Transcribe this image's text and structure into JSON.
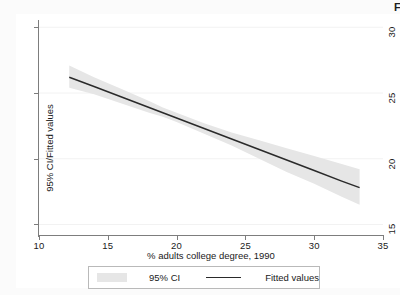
{
  "figure": {
    "corner_artifact": "F",
    "background": "#ffffff"
  },
  "chart_data": {
    "type": "line",
    "title": "",
    "xlabel": "% adults college degree, 1990",
    "ylabel": "95% CI/Fitted values",
    "xlim": [
      10,
      35
    ],
    "ylim": [
      14.2,
      30.4
    ],
    "xticks": [
      10,
      15,
      20,
      25,
      30,
      35
    ],
    "yticks": [
      15,
      20,
      25,
      30
    ],
    "xtick_labels": [
      "10",
      "15",
      "20",
      "25",
      "30",
      "35"
    ],
    "ytick_labels": [
      "15",
      "20",
      "25",
      "30"
    ],
    "grid": "horizontal-faint",
    "legend_position": "below-axes",
    "legend": [
      {
        "label": "95% CI",
        "marker": "band",
        "color": "#e6e6e6"
      },
      {
        "label": "Fitted values",
        "marker": "line",
        "color": "#2a2a2a"
      }
    ],
    "series": [
      {
        "name": "Fitted values",
        "type": "line",
        "color": "#2a2a2a",
        "x": [
          12.2,
          14.0,
          16.0,
          18.0,
          19.0,
          20.0,
          22.0,
          24.0,
          26.0,
          28.0,
          30.0,
          32.0,
          33.3
        ],
        "y": [
          26.2,
          25.5,
          24.7,
          23.9,
          23.5,
          23.1,
          22.3,
          21.5,
          20.7,
          19.9,
          19.1,
          18.3,
          17.8
        ]
      },
      {
        "name": "95% CI",
        "type": "band",
        "color": "#e6e6e6",
        "x": [
          12.2,
          14.0,
          16.0,
          18.0,
          19.0,
          20.0,
          22.0,
          24.0,
          26.0,
          28.0,
          30.0,
          32.0,
          33.3
        ],
        "lower": [
          25.4,
          24.9,
          24.2,
          23.5,
          23.2,
          22.8,
          21.9,
          21.0,
          20.0,
          19.0,
          18.1,
          17.1,
          16.5
        ],
        "upper": [
          27.1,
          26.2,
          25.3,
          24.4,
          23.9,
          23.5,
          22.7,
          22.0,
          21.4,
          20.8,
          20.2,
          19.6,
          19.2
        ]
      }
    ],
    "fit": {
      "slope": -0.4,
      "intercept": 31.1,
      "x_start": 12.2,
      "x_end": 33.3,
      "y_start": 26.2,
      "y_end": 17.8
    }
  }
}
